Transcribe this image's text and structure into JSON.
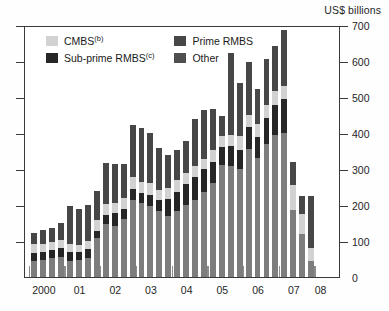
{
  "unit_caption": "US$ billions",
  "legend": {
    "items": [
      {
        "label": "CMBS",
        "sup": "(b)",
        "color": "#d2d2d2",
        "key": "cmbs",
        "icon": "legend-swatch-cmbs"
      },
      {
        "label": "Prime RMBS",
        "sup": "",
        "color": "#474747",
        "key": "prime",
        "icon": "legend-swatch-prime"
      },
      {
        "label": "Sub-prime RMBS",
        "sup": "(c)",
        "color": "#262626",
        "key": "sub",
        "icon": "legend-swatch-subprime"
      },
      {
        "label": "Other",
        "sup": "",
        "color": "#4f4f4f",
        "key": "other",
        "icon": "legend-swatch-other"
      }
    ]
  },
  "chart_data": {
    "type": "bar",
    "stacked": true,
    "title": "",
    "subtitle": "",
    "xlabel": "",
    "ylabel": "US$ billions",
    "ylim": [
      0,
      700
    ],
    "ytick_step": 100,
    "yticks": [
      0,
      100,
      200,
      300,
      400,
      500,
      600,
      700
    ],
    "ytick_labels": [
      "0",
      "100",
      "200",
      "300",
      "400",
      "500",
      "600",
      "700"
    ],
    "grid": false,
    "legend_position": "top-left-inside",
    "x_tick_labels": [
      "2000",
      "01",
      "02",
      "03",
      "04",
      "05",
      "06",
      "07",
      "08"
    ],
    "x_group_label_positions": [
      1.5,
      5.5,
      9.5,
      13.5,
      17.5,
      21.5,
      25.5,
      29.5,
      32.5
    ],
    "frequency": "quarterly",
    "x": [
      "2000 Q1",
      "2000 Q2",
      "2000 Q3",
      "2000 Q4",
      "2001 Q1",
      "2001 Q2",
      "2001 Q3",
      "2001 Q4",
      "2002 Q1",
      "2002 Q2",
      "2002 Q3",
      "2002 Q4",
      "2003 Q1",
      "2003 Q2",
      "2003 Q3",
      "2003 Q4",
      "2004 Q1",
      "2004 Q2",
      "2004 Q3",
      "2004 Q4",
      "2005 Q1",
      "2005 Q2",
      "2005 Q3",
      "2005 Q4",
      "2006 Q1",
      "2006 Q2",
      "2006 Q3",
      "2006 Q4",
      "2007 Q1",
      "2007 Q2",
      "2007 Q3",
      "2007 Q4",
      "2008 Q1",
      "2008 Q2"
    ],
    "stack_order_bottom_to_top": [
      "prime",
      "sub",
      "cmbs",
      "other"
    ],
    "series": [
      {
        "name": "Prime RMBS",
        "key": "prime",
        "color": "#7d7d7d",
        "values": [
          45,
          48,
          52,
          55,
          45,
          47,
          52,
          108,
          148,
          142,
          160,
          215,
          205,
          198,
          183,
          170,
          182,
          200,
          215,
          235,
          260,
          310,
          308,
          300,
          355,
          330,
          370,
          395,
          400,
          185,
          120,
          45,
          0,
          0
        ]
      },
      {
        "name": "Sub-prime RMBS",
        "key": "sub",
        "color": "#262626",
        "values": [
          22,
          22,
          24,
          25,
          25,
          23,
          25,
          20,
          25,
          35,
          30,
          30,
          28,
          30,
          32,
          48,
          55,
          58,
          62,
          65,
          60,
          52,
          55,
          52,
          62,
          58,
          72,
          82,
          95,
          0,
          0,
          0,
          0,
          0
        ]
      },
      {
        "name": "CMBS",
        "key": "cmbs",
        "color": "#d2d2d2",
        "values": [
          25,
          22,
          22,
          22,
          22,
          20,
          22,
          30,
          30,
          28,
          30,
          32,
          30,
          32,
          28,
          30,
          32,
          30,
          32,
          28,
          32,
          30,
          32,
          40,
          32,
          38,
          35,
          40,
          35,
          70,
          55,
          35,
          0,
          0
        ]
      },
      {
        "name": "Other",
        "key": "other",
        "color": "#474747",
        "values": [
          30,
          38,
          37,
          48,
          105,
          100,
          102,
          80,
          115,
          110,
          95,
          145,
          150,
          140,
          115,
          90,
          85,
          90,
          130,
          135,
          115,
          55,
          228,
          148,
          148,
          95,
          130,
          125,
          155,
          65,
          50,
          145,
          0,
          0
        ]
      }
    ],
    "totals": [
      122,
      130,
      135,
      150,
      197,
      190,
      201,
      238,
      318,
      315,
      315,
      422,
      413,
      400,
      358,
      338,
      354,
      378,
      439,
      463,
      467,
      447,
      623,
      540,
      597,
      521,
      607,
      642,
      685,
      320,
      225,
      225,
      0,
      0
    ]
  }
}
